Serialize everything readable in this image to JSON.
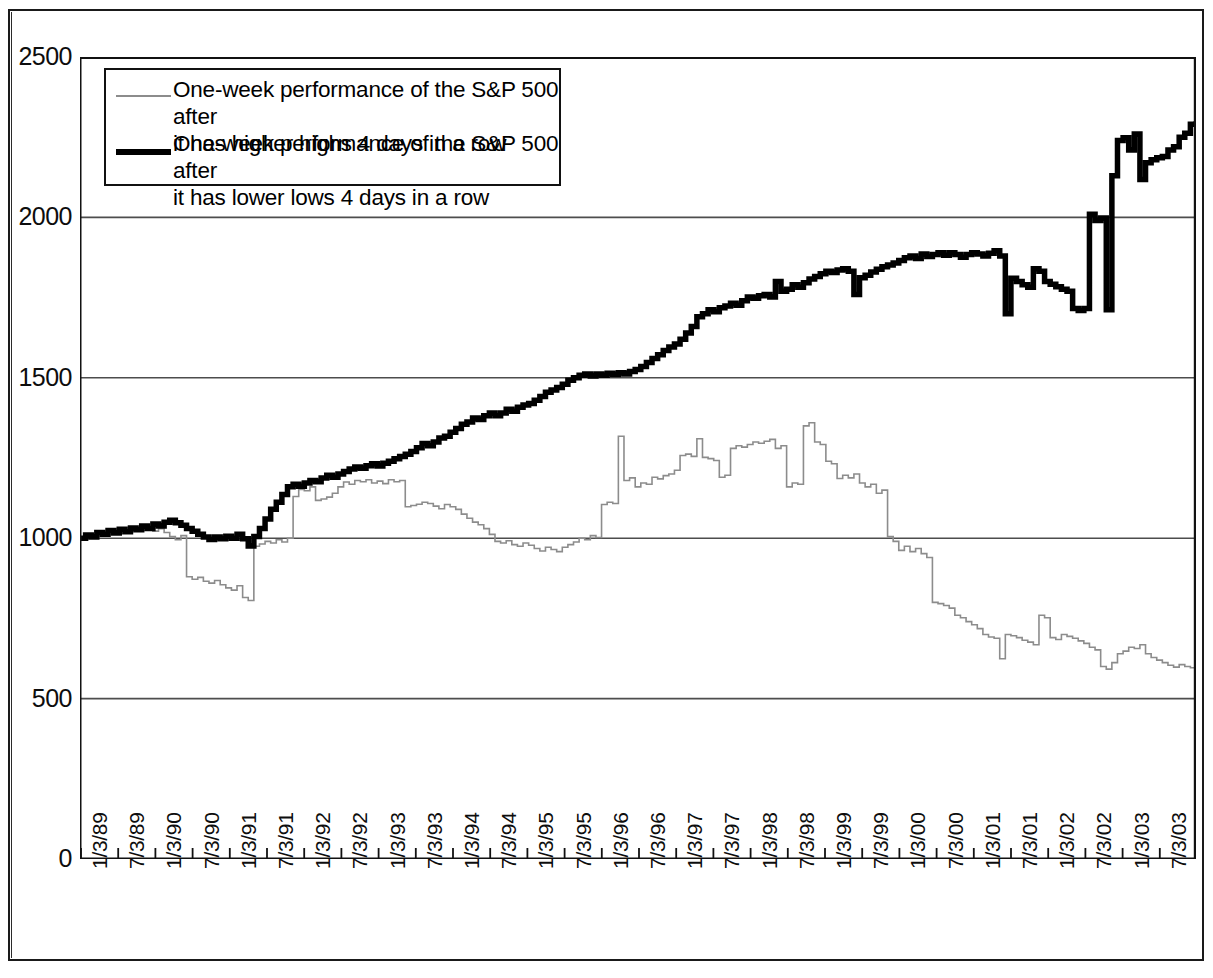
{
  "chart_data": {
    "type": "line",
    "title": "",
    "subtitle": "",
    "xlabel": "",
    "ylabel": "",
    "ylim": [
      0,
      2500
    ],
    "yticks": [
      0,
      500,
      1000,
      1500,
      2000,
      2500
    ],
    "ytick_labels": [
      "0",
      "500",
      "1000",
      "1500",
      "2000",
      "2500"
    ],
    "grid": "horizontal",
    "legend_position": "upper-left-inside",
    "xtick_labels": [
      "1/3/89",
      "7/3/89",
      "1/3/90",
      "7/3/90",
      "1/3/91",
      "7/3/91",
      "1/3/92",
      "7/3/92",
      "1/3/93",
      "7/3/93",
      "1/3/94",
      "7/3/94",
      "1/3/95",
      "7/3/95",
      "1/3/96",
      "7/3/96",
      "1/3/97",
      "7/3/97",
      "1/3/98",
      "7/3/98",
      "1/3/99",
      "7/3/99",
      "1/3/00",
      "7/3/00",
      "1/3/01",
      "7/3/01",
      "1/3/02",
      "7/3/02",
      "1/3/03",
      "7/3/03"
    ],
    "series": [
      {
        "name": "One-week performance of the S&P 500 after it has higher highs 4 days in a row",
        "style": "thin",
        "color": "#8c8c8c",
        "linewidth": 1.6,
        "shape": "step",
        "values": [
          1000,
          1012,
          1005,
          1020,
          1008,
          1025,
          1018,
          1030,
          1022,
          1035,
          1028,
          1040,
          1032,
          1022,
          1030,
          1018,
          1005,
          995,
          1008,
          880,
          872,
          878,
          866,
          860,
          868,
          855,
          845,
          838,
          852,
          815,
          806,
          975,
          982,
          990,
          985,
          995,
          988,
          1000,
          1130,
          1152,
          1148,
          1160,
          1118,
          1122,
          1128,
          1140,
          1160,
          1175,
          1168,
          1180,
          1176,
          1182,
          1172,
          1178,
          1170,
          1182,
          1176,
          1180,
          1098,
          1102,
          1106,
          1112,
          1108,
          1100,
          1092,
          1105,
          1098,
          1090,
          1075,
          1062,
          1050,
          1042,
          1030,
          1012,
          990,
          985,
          992,
          980,
          975,
          985,
          978,
          968,
          960,
          972,
          965,
          958,
          972,
          980,
          988,
          1000,
          995,
          1008,
          1002,
          1105,
          1112,
          1108,
          1318,
          1180,
          1188,
          1160,
          1172,
          1168,
          1190,
          1185,
          1195,
          1200,
          1212,
          1258,
          1262,
          1255,
          1310,
          1252,
          1248,
          1242,
          1190,
          1196,
          1280,
          1288,
          1284,
          1292,
          1300,
          1296,
          1302,
          1308,
          1280,
          1288,
          1160,
          1172,
          1168,
          1350,
          1360,
          1300,
          1292,
          1240,
          1232,
          1186,
          1196,
          1188,
          1200,
          1172,
          1160,
          1168,
          1140,
          1150,
          1005,
          990,
          962,
          975,
          958,
          968,
          952,
          940,
          800,
          796,
          790,
          782,
          760,
          752,
          740,
          730,
          718,
          700,
          692,
          688,
          624,
          700,
          696,
          690,
          682,
          676,
          668,
          760,
          752,
          690,
          684,
          700,
          694,
          688,
          680,
          672,
          660,
          652,
          600,
          592,
          612,
          640,
          648,
          660,
          656,
          668,
          640,
          628,
          620,
          612,
          604,
          598,
          606,
          600,
          596,
          600
        ]
      },
      {
        "name": "One-week performance of the S&P 500 after it has lower lows 4 days in a row",
        "style": "thick",
        "color": "#000000",
        "linewidth": 5.5,
        "shape": "step",
        "values": [
          1000,
          1010,
          1004,
          1018,
          1012,
          1024,
          1016,
          1028,
          1020,
          1032,
          1026,
          1038,
          1030,
          1044,
          1038,
          1050,
          1056,
          1048,
          1040,
          1030,
          1022,
          1012,
          1004,
          996,
          1004,
          998,
          1006,
          1000,
          1012,
          998,
          976,
          1005,
          1030,
          1060,
          1090,
          1112,
          1136,
          1160,
          1168,
          1162,
          1172,
          1180,
          1176,
          1188,
          1196,
          1190,
          1200,
          1208,
          1216,
          1222,
          1218,
          1226,
          1232,
          1225,
          1234,
          1240,
          1248,
          1255,
          1262,
          1270,
          1282,
          1295,
          1288,
          1300,
          1312,
          1318,
          1330,
          1342,
          1355,
          1362,
          1375,
          1370,
          1382,
          1390,
          1382,
          1390,
          1402,
          1396,
          1408,
          1415,
          1420,
          1430,
          1442,
          1455,
          1462,
          1470,
          1480,
          1492,
          1500,
          1508,
          1512,
          1506,
          1512,
          1508,
          1514,
          1510,
          1516,
          1512,
          1520,
          1526,
          1535,
          1548,
          1560,
          1572,
          1585,
          1596,
          1605,
          1620,
          1640,
          1660,
          1690,
          1700,
          1712,
          1706,
          1718,
          1724,
          1732,
          1726,
          1740,
          1752,
          1748,
          1756,
          1760,
          1752,
          1800,
          1770,
          1776,
          1790,
          1782,
          1796,
          1808,
          1816,
          1824,
          1832,
          1828,
          1836,
          1840,
          1832,
          1760,
          1812,
          1820,
          1830,
          1838,
          1846,
          1852,
          1858,
          1866,
          1874,
          1880,
          1872,
          1886,
          1878,
          1884,
          1890,
          1882,
          1890,
          1884,
          1876,
          1884,
          1890,
          1886,
          1880,
          1888,
          1896,
          1880,
          1700,
          1810,
          1800,
          1790,
          1782,
          1840,
          1832,
          1800,
          1792,
          1784,
          1776,
          1770,
          1716,
          1710,
          1716,
          2010,
          1990,
          1998,
          1712,
          2130,
          2240,
          2248,
          2210,
          2260,
          2118,
          2170,
          2180,
          2186,
          2190,
          2210,
          2220,
          2250,
          2262,
          2290,
          2300
        ]
      }
    ]
  },
  "legend": {
    "items": [
      {
        "swatch": "thin-line-swatch",
        "label": "One-week performance of the S&P 500 after\nit has higher highs 4 days in a row"
      },
      {
        "swatch": "thick-line-swatch",
        "label": "One-week performance of the S&P 500 after\nit has lower lows 4 days in a row"
      }
    ]
  },
  "colors": {
    "thin_series": "#8c8c8c",
    "thick_series": "#000000",
    "axis": "#1a1a1a",
    "gridline": "#4d4d4d",
    "background": "#ffffff"
  }
}
